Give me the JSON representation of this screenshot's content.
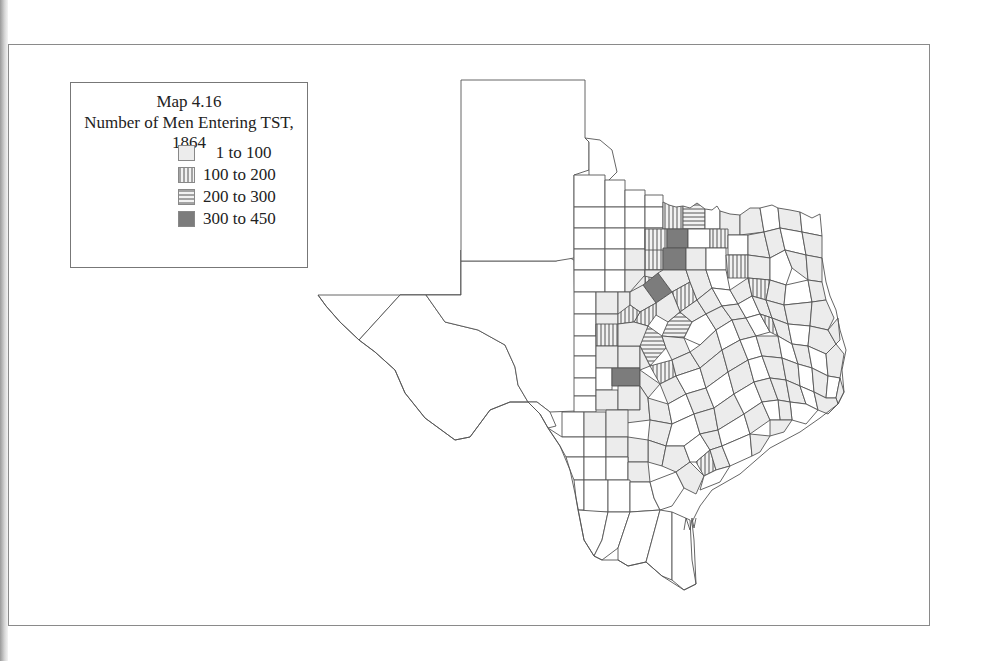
{
  "figure": {
    "title": "Map 4.16",
    "subtitle": "Number of Men Entering TST, 1864"
  },
  "legend": {
    "items": [
      {
        "label": "   1 to 100",
        "pattern": "light-fill",
        "color": "#ececec"
      },
      {
        "label": "100 to 200",
        "pattern": "vertical-stripes",
        "color": "#666666"
      },
      {
        "label": "200 to 300",
        "pattern": "horizontal-stripes",
        "color": "#666666"
      },
      {
        "label": "300 to 450",
        "pattern": "dark-fill",
        "color": "#7a7a7a"
      }
    ]
  },
  "map": {
    "region": "Texas counties",
    "classes": {
      "none": "#ffffff",
      "c1": "#ececec",
      "c4": "#7c7c7c"
    }
  }
}
